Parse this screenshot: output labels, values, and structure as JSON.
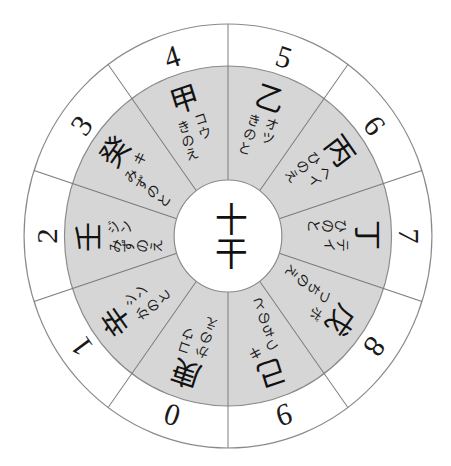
{
  "diagram": {
    "title": "十干",
    "center_label": "十干",
    "segments": [
      {
        "kanji": "甲",
        "on_reading": "コウ",
        "kun_reading": "きのえ",
        "number": "4"
      },
      {
        "kanji": "乙",
        "on_reading": "オツ",
        "kun_reading": "きのと",
        "number": "5"
      },
      {
        "kanji": "丙",
        "on_reading": "ヘイ",
        "kun_reading": "ひのえ",
        "number": "6"
      },
      {
        "kanji": "丁",
        "on_reading": "テイ",
        "kun_reading": "ひのと",
        "number": "7"
      },
      {
        "kanji": "戊",
        "on_reading": "ボ",
        "kun_reading": "つちのえ",
        "number": "8"
      },
      {
        "kanji": "己",
        "on_reading": "キ",
        "kun_reading": "つちのと",
        "number": "9"
      },
      {
        "kanji": "庚",
        "on_reading": "コウ",
        "kun_reading": "かのえ",
        "number": "0"
      },
      {
        "kanji": "辛",
        "on_reading": "シン",
        "kun_reading": "かのと",
        "number": "1"
      },
      {
        "kanji": "壬",
        "on_reading": "ジン",
        "kun_reading": "みずのえ",
        "number": "2"
      },
      {
        "kanji": "癸",
        "on_reading": "キ",
        "kun_reading": "みずのと",
        "number": "3"
      }
    ]
  },
  "colors": {
    "ring_fill": "#d6d6d6",
    "outer_fill": "#ffffff",
    "line": "#8a8a8a",
    "text": "#111111"
  }
}
